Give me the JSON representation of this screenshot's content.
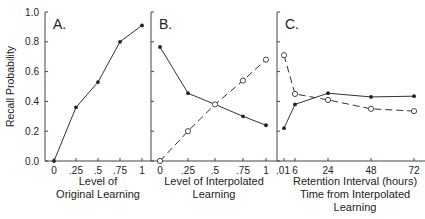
{
  "chart_data": [
    {
      "type": "line",
      "panel": "A.",
      "title": "",
      "ylabel": "Recall Probability",
      "xlabel": [
        "Level of",
        "Original Learning"
      ],
      "ylim": [
        0,
        1.0
      ],
      "yticks": [
        "0.0",
        "0.2",
        "0.4",
        "0.6",
        "0.8",
        "1.0"
      ],
      "categories": [
        "0",
        ".25",
        ".5",
        ".75",
        "1"
      ],
      "series": [
        {
          "name": "Original learning",
          "marker": "filled",
          "style": "solid",
          "values": [
            0.0,
            0.36,
            0.53,
            0.8,
            0.91
          ]
        }
      ],
      "grid": false
    },
    {
      "type": "line",
      "panel": "B.",
      "title": "",
      "xlabel": [
        "Level of Interpolated",
        "Learning"
      ],
      "ylim": [
        0,
        1.0
      ],
      "categories": [
        "0",
        ".25",
        ".5",
        ".75",
        "1"
      ],
      "series": [
        {
          "name": "Original (filled)",
          "marker": "filled",
          "style": "solid",
          "values": [
            0.765,
            0.455,
            0.38,
            0.3,
            0.24
          ]
        },
        {
          "name": "Interpolated (open)",
          "marker": "open",
          "style": "dashed",
          "values": [
            0.0,
            0.2,
            0.38,
            0.54,
            0.68
          ]
        }
      ],
      "grid": false
    },
    {
      "type": "line",
      "panel": "C.",
      "title": "",
      "xlabel": [
        "Retention Interval (hours)",
        "Time from Interpolated",
        "Learning"
      ],
      "ylim": [
        0,
        1.0
      ],
      "categories": [
        ".01",
        "6",
        "24",
        "48",
        "72"
      ],
      "x": [
        0.01,
        6,
        24,
        48,
        72
      ],
      "series": [
        {
          "name": "Original (filled)",
          "marker": "filled",
          "style": "solid",
          "values": [
            0.22,
            0.38,
            0.455,
            0.43,
            0.435
          ]
        },
        {
          "name": "Interpolated (open)",
          "marker": "open",
          "style": "dashed",
          "values": [
            0.71,
            0.45,
            0.41,
            0.35,
            0.335
          ]
        }
      ],
      "grid": false
    }
  ]
}
